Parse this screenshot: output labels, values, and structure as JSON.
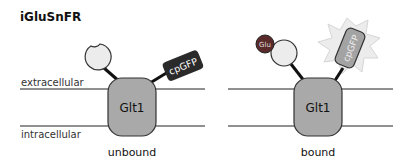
{
  "title": "iGluSnFR",
  "labels": {
    "extracellular": "extracellular",
    "intracellular": "intracellular"
  },
  "panels": [
    {
      "state": "unbound",
      "transporter": "Glt1",
      "fluorophore": "cpGFP",
      "ligand": null
    },
    {
      "state": "bound",
      "transporter": "Glt1",
      "fluorophore": "cpGFP",
      "ligand": "Glu"
    }
  ],
  "colors": {
    "membrane": "#6b6b6b",
    "transporter_fill": "#a9a9a9",
    "binding_domain_fill": "#ececec",
    "cpgfp_dark": "#2a2a2a",
    "cpgfp_bright": "#a3a3a3",
    "glow": "#ececec",
    "glutamate": "#5a2a2a"
  }
}
